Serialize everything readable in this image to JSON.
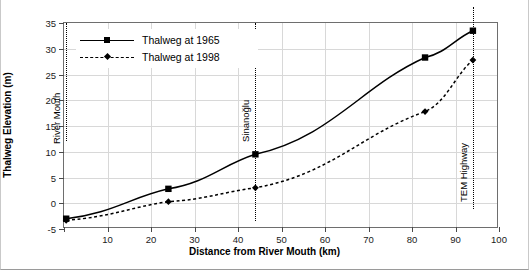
{
  "chart_data": {
    "type": "line",
    "title": "",
    "xlabel": "Distance from River Mouth (km)",
    "ylabel": "Thalweg Elevation (m)",
    "xlim": [
      0,
      100
    ],
    "ylim": [
      -5,
      35
    ],
    "xticks": [
      0,
      10,
      20,
      30,
      40,
      50,
      60,
      70,
      80,
      90,
      100
    ],
    "xticklabels": [
      "",
      "10",
      "20",
      "30",
      "40",
      "50",
      "60",
      "70",
      "80",
      "90",
      "100"
    ],
    "yticks": [
      -5,
      0,
      5,
      10,
      15,
      20,
      25,
      30,
      35
    ],
    "yticklabels": [
      "-5",
      "0",
      "5",
      "10",
      "15",
      "20",
      "25",
      "30",
      "35"
    ],
    "grid": true,
    "legend_position": "upper-left",
    "series": [
      {
        "name": "Thalweg at 1965",
        "marker": "square",
        "linestyle": "solid",
        "color": "#000000",
        "x": [
          0.5,
          24,
          44,
          83,
          94
        ],
        "y": [
          -3.0,
          2.8,
          9.5,
          28.3,
          33.5
        ]
      },
      {
        "name": "Thalweg at 1998",
        "marker": "diamond",
        "linestyle": "dashed",
        "color": "#000000",
        "x": [
          0.5,
          24,
          44,
          83,
          94
        ],
        "y": [
          -3.3,
          0.3,
          3.0,
          17.8,
          27.8
        ]
      }
    ],
    "annotations": [
      {
        "label": "River Mouth",
        "x": 0.5,
        "orientation": "vertical"
      },
      {
        "label": "Sinanoğlu",
        "x": 44,
        "orientation": "vertical"
      },
      {
        "label": "TEM Highway",
        "x": 94,
        "orientation": "vertical"
      }
    ]
  },
  "legend": {
    "items": [
      {
        "label": "Thalweg at 1965"
      },
      {
        "label": "Thalweg at 1998"
      }
    ]
  }
}
